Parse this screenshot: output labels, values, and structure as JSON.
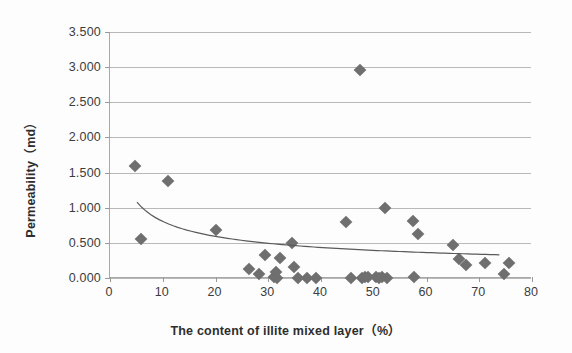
{
  "chart_data": {
    "type": "scatter",
    "title": "",
    "xlabel": "The content of illite mixed layer（%）",
    "ylabel": "Permeability（md）",
    "xlim": [
      0,
      80
    ],
    "ylim": [
      0,
      3.5
    ],
    "xticks": [
      0,
      10,
      20,
      30,
      40,
      50,
      60,
      70,
      80
    ],
    "yticks": [
      0.0,
      0.5,
      1.0,
      1.5,
      2.0,
      2.5,
      3.0,
      3.5
    ],
    "ytick_labels": [
      "0.000",
      "0.500",
      "1.000",
      "1.500",
      "2.000",
      "2.500",
      "3.000",
      "3.500"
    ],
    "xtick_labels": [
      "0",
      "10",
      "20",
      "30",
      "40",
      "50",
      "60",
      "70",
      "80"
    ],
    "grid": "horizontal",
    "legend": "none",
    "marker": "diamond",
    "marker_color": "#6f6f6f",
    "series": [
      {
        "name": "Permeability vs illite mixed layer content",
        "points": [
          [
            4.8,
            1.6
          ],
          [
            5.9,
            0.56
          ],
          [
            11.0,
            1.38
          ],
          [
            20.1,
            0.69
          ],
          [
            26.3,
            0.13
          ],
          [
            28.2,
            0.06
          ],
          [
            29.3,
            0.33
          ],
          [
            31.0,
            0.02
          ],
          [
            31.4,
            0.09
          ],
          [
            31.6,
            0.0
          ],
          [
            32.3,
            0.28
          ],
          [
            34.5,
            0.5
          ],
          [
            34.8,
            0.15
          ],
          [
            35.7,
            0.0
          ],
          [
            37.3,
            0.0
          ],
          [
            39.0,
            0.0
          ],
          [
            44.8,
            0.8
          ],
          [
            45.6,
            0.0
          ],
          [
            47.4,
            2.96
          ],
          [
            47.7,
            0.0
          ],
          [
            48.3,
            0.02
          ],
          [
            49.0,
            0.01
          ],
          [
            50.4,
            0.02
          ],
          [
            51.0,
            0.0
          ],
          [
            51.6,
            0.01
          ],
          [
            52.2,
            1.0
          ],
          [
            52.6,
            0.0
          ],
          [
            57.4,
            0.81
          ],
          [
            57.6,
            0.02
          ],
          [
            58.3,
            0.63
          ],
          [
            65.1,
            0.47
          ],
          [
            66.2,
            0.27
          ],
          [
            67.5,
            0.18
          ],
          [
            71.0,
            0.22
          ],
          [
            74.7,
            0.06
          ],
          [
            75.6,
            0.22
          ]
        ]
      }
    ],
    "trendline": {
      "type": "power",
      "description": "decreasing power-law fit",
      "x_start": 5.3,
      "y_start": 1.08,
      "x_end": 74.0,
      "y_end": 0.33
    }
  }
}
